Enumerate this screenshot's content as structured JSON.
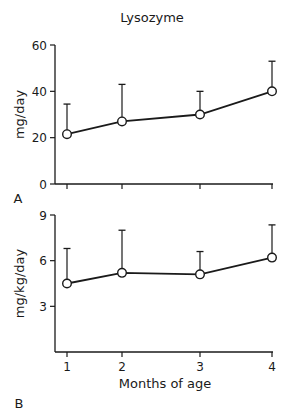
{
  "title": "Lysozyme",
  "xlabel": "Months of age",
  "chart_data": [
    {
      "type": "line",
      "panel_label": "A",
      "title": "Lysozyme",
      "xlabel": "",
      "ylabel": "mg/day",
      "x": [
        1,
        2,
        3,
        4
      ],
      "x_tick_labels": [],
      "y_ticks": [
        0,
        20,
        40,
        60
      ],
      "ylim": [
        0,
        60
      ],
      "series": [
        {
          "name": "Lysozyme (mg/day)",
          "values": [
            21.5,
            27,
            30,
            40
          ],
          "error_upper": [
            34.5,
            43,
            40,
            53
          ]
        }
      ],
      "grid": false,
      "legend": null
    },
    {
      "type": "line",
      "panel_label": "B",
      "title": "",
      "xlabel": "Months of age",
      "ylabel": "mg/kg/day",
      "x": [
        1,
        2,
        3,
        4
      ],
      "x_tick_labels": [
        "1",
        "2",
        "3",
        "4"
      ],
      "y_ticks": [
        3,
        6,
        9
      ],
      "ylim": [
        0,
        9
      ],
      "series": [
        {
          "name": "Lysozyme (mg/kg/day)",
          "values": [
            4.5,
            5.2,
            5.1,
            6.2
          ],
          "error_upper": [
            6.8,
            8.0,
            6.6,
            8.35
          ]
        }
      ],
      "grid": false,
      "legend": null
    }
  ],
  "colors": {
    "line": "#1a1a1a",
    "marker_fill": "#ffffff",
    "background": "#ffffff"
  }
}
